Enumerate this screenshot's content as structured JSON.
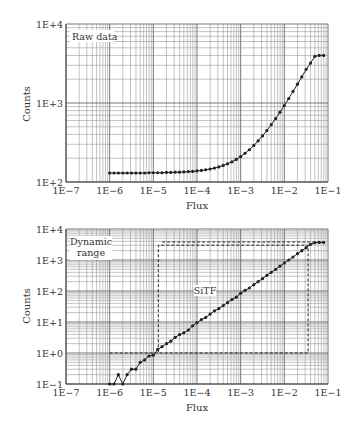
{
  "chart_data": [
    {
      "type": "line",
      "panel": "top",
      "title": "",
      "annotation": "Raw data",
      "xlabel": "Flux",
      "ylabel": "Counts",
      "xscale": "log",
      "yscale": "log",
      "xlim": [
        1e-07,
        0.1
      ],
      "ylim": [
        100.0,
        10000.0
      ],
      "xticks": [
        "1E−7",
        "1E−6",
        "1E−5",
        "1E−4",
        "1E−3",
        "1E−2",
        "1E−1"
      ],
      "yticks": [
        "1E+2",
        "1E+3",
        "1E+4"
      ],
      "grid": true,
      "series": [
        {
          "name": "Raw data",
          "marker": "circle",
          "x": [
            1e-06,
            1.26e-06,
            1.58e-06,
            2e-06,
            2.51e-06,
            3.16e-06,
            3.98e-06,
            5.01e-06,
            6.31e-06,
            7.94e-06,
            1e-05,
            1.26e-05,
            1.58e-05,
            2e-05,
            2.51e-05,
            3.16e-05,
            3.98e-05,
            5.01e-05,
            6.31e-05,
            7.94e-05,
            0.0001,
            0.000126,
            0.000158,
            0.0002,
            0.000251,
            0.000316,
            0.000398,
            0.000501,
            0.000631,
            0.000794,
            0.001,
            0.00126,
            0.00158,
            0.002,
            0.00251,
            0.00316,
            0.00398,
            0.00501,
            0.00631,
            0.00794,
            0.01,
            0.0126,
            0.0158,
            0.02,
            0.0251,
            0.0316,
            0.0398,
            0.0501,
            0.0631,
            0.0794
          ],
          "y": [
            130,
            130,
            130,
            130,
            130,
            130,
            130,
            130,
            130,
            131,
            131,
            131,
            131,
            132,
            132,
            133,
            133,
            134,
            135,
            136,
            138,
            140,
            143,
            146,
            150,
            155,
            162,
            170,
            180,
            193,
            210,
            231,
            256,
            290,
            331,
            383,
            448,
            531,
            635,
            765,
            930,
            1138,
            1400,
            1730,
            2140,
            2660,
            3200,
            3900,
            4000,
            4000
          ]
        }
      ]
    },
    {
      "type": "line",
      "panel": "bottom",
      "title": "",
      "annotations": [
        "Dynamic range",
        "SiTF"
      ],
      "xlabel": "Flux",
      "ylabel": "Counts",
      "xscale": "log",
      "yscale": "log",
      "xlim": [
        1e-07,
        0.1
      ],
      "ylim": [
        0.1,
        10000.0
      ],
      "xticks": [
        "1E−7",
        "1E−6",
        "1E−5",
        "1E−4",
        "1E−3",
        "1E−2",
        "1E−1"
      ],
      "yticks": [
        "1E−1",
        "1E+0",
        "1E+1",
        "1E+2",
        "1E+3",
        "1E+4"
      ],
      "grid": true,
      "series": [
        {
          "name": "SiTF",
          "marker": "circle",
          "x": [
            1e-06,
            1.26e-06,
            1.58e-06,
            2e-06,
            2.51e-06,
            3.16e-06,
            3.98e-06,
            5.01e-06,
            6.31e-06,
            7.94e-06,
            1e-05,
            1.26e-05,
            1.58e-05,
            2e-05,
            2.51e-05,
            3.16e-05,
            3.98e-05,
            5.01e-05,
            6.31e-05,
            7.94e-05,
            0.0001,
            0.000126,
            0.000158,
            0.0002,
            0.000251,
            0.000316,
            0.000398,
            0.000501,
            0.000631,
            0.000794,
            0.001,
            0.00126,
            0.00158,
            0.002,
            0.00251,
            0.00316,
            0.00398,
            0.00501,
            0.00631,
            0.00794,
            0.01,
            0.0126,
            0.0158,
            0.02,
            0.0251,
            0.0316,
            0.0398,
            0.0501,
            0.0631,
            0.0794
          ],
          "y": [
            0.1,
            0.1,
            0.2,
            0.1,
            0.2,
            0.3,
            0.3,
            0.5,
            0.6,
            0.8,
            0.85,
            1.3,
            1.6,
            2.0,
            2.4,
            3.2,
            3.9,
            4.5,
            5.5,
            7.5,
            9.5,
            12,
            14,
            18,
            23,
            27,
            34,
            42,
            53,
            63,
            85,
            105,
            125,
            160,
            200,
            250,
            320,
            400,
            500,
            630,
            800,
            1000,
            1250,
            1600,
            2000,
            2500,
            3200,
            3600,
            3700,
            3700
          ]
        },
        {
          "name": "Dynamic range box (lower)",
          "style": "dashed",
          "x": [
            1e-06,
            0.035,
            0.035,
            1.3e-05,
            1.3e-05
          ],
          "y": [
            1.0,
            1.0,
            3000,
            3000,
            1.0
          ]
        },
        {
          "name": "Dynamic range top line",
          "style": "dashed",
          "x": [
            1.6e-05,
            0.0794
          ],
          "y": [
            3800,
            3800
          ]
        }
      ]
    }
  ],
  "labels": {
    "top": {
      "annotation": "Raw data",
      "xlabel": "Flux",
      "ylabel": "Counts"
    },
    "bottom": {
      "annotation_line1": "Dynamic",
      "annotation_line2": "range",
      "sitf": "SiTF",
      "xlabel": "Flux",
      "ylabel": "Counts"
    }
  },
  "colors": {
    "grid": "#9a9a9a",
    "grid_major": "#6a6a6a",
    "axis": "#444444",
    "data": "#222222",
    "text": "#333333"
  }
}
